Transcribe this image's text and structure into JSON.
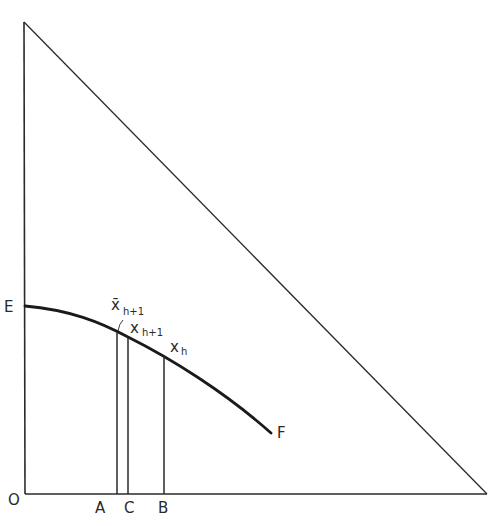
{
  "diagram": {
    "type": "geometric-construction",
    "colors": {
      "ink": "#2a2a2a",
      "background": "#ffffff"
    },
    "axes": {
      "origin_label": "O",
      "origin": [
        25,
        494
      ],
      "vertical_top": [
        24,
        22
      ],
      "horizontal_end": [
        487,
        494
      ]
    },
    "hypotenuse": {
      "from": [
        24,
        22
      ],
      "to": [
        487,
        494
      ]
    },
    "curve": {
      "start_label": "E",
      "end_label": "F",
      "points": [
        [
          25,
          306
        ],
        [
          117,
          332
        ],
        [
          128,
          337
        ],
        [
          164,
          356
        ],
        [
          271,
          433
        ]
      ]
    },
    "verticals": [
      {
        "foot_label": "A",
        "x": 117,
        "top_y": 332
      },
      {
        "foot_label": "C",
        "x": 128,
        "top_y": 337
      },
      {
        "foot_label": "B",
        "x": 164,
        "top_y": 356
      }
    ],
    "point_labels": {
      "xbar_h1": {
        "base": "x̄",
        "sub": "h+1"
      },
      "x_h1": {
        "base": "x",
        "sub": "h+1"
      },
      "x_h": {
        "base": "x",
        "sub": "h"
      }
    }
  }
}
